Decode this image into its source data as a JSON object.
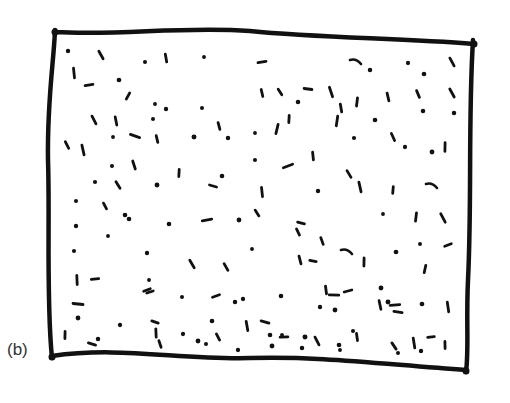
{
  "figure": {
    "panel_label": "(b)",
    "stroke_color": "#111111",
    "background": "#ffffff",
    "frame": {
      "path": "M55,32 C120,36 180,26 250,31 C320,38 400,38 474,44 M473,40 C468,120 472,200 468,280 C466,320 469,350 466,372 M466,370 C380,364 320,356 250,358 C180,360 120,346 52,356 M52,358 C46,300 50,220 48,160 C47,100 54,60 55,30"
    },
    "marks": [
      [
        68,
        51,
        "d"
      ],
      [
        101,
        55,
        "v"
      ],
      [
        145,
        62,
        "d"
      ],
      [
        166,
        58,
        "v"
      ],
      [
        204,
        57,
        "d"
      ],
      [
        74,
        73,
        "v"
      ],
      [
        89,
        85,
        "h"
      ],
      [
        119,
        80,
        "d"
      ],
      [
        128,
        96,
        "s"
      ],
      [
        155,
        104,
        "d"
      ],
      [
        166,
        109,
        "d"
      ],
      [
        202,
        108,
        "d"
      ],
      [
        94,
        120,
        "v"
      ],
      [
        116,
        121,
        "v"
      ],
      [
        153,
        119,
        "d"
      ],
      [
        113,
        137,
        "d"
      ],
      [
        135,
        136,
        "h"
      ],
      [
        157,
        139,
        "v"
      ],
      [
        194,
        137,
        "d"
      ],
      [
        219,
        126,
        "v"
      ],
      [
        228,
        138,
        "d"
      ],
      [
        222,
        176,
        "d"
      ],
      [
        67,
        145,
        "v"
      ],
      [
        83,
        150,
        "v"
      ],
      [
        112,
        166,
        "d"
      ],
      [
        134,
        165,
        "v"
      ],
      [
        179,
        173,
        "v"
      ],
      [
        95,
        182,
        "d"
      ],
      [
        118,
        185,
        "v"
      ],
      [
        157,
        185,
        "d"
      ],
      [
        213,
        186,
        "h"
      ],
      [
        262,
        62,
        "h"
      ],
      [
        356,
        62,
        "c"
      ],
      [
        370,
        70,
        "d"
      ],
      [
        408,
        63,
        "d"
      ],
      [
        424,
        74,
        "d"
      ],
      [
        452,
        62,
        "v"
      ],
      [
        262,
        93,
        "v"
      ],
      [
        280,
        92,
        "v"
      ],
      [
        308,
        89,
        "h"
      ],
      [
        298,
        102,
        "d"
      ],
      [
        331,
        92,
        "v"
      ],
      [
        341,
        108,
        "v"
      ],
      [
        357,
        102,
        "v"
      ],
      [
        388,
        97,
        "v"
      ],
      [
        418,
        94,
        "v"
      ],
      [
        452,
        93,
        "v"
      ],
      [
        289,
        119,
        "v"
      ],
      [
        277,
        129,
        "v"
      ],
      [
        337,
        121,
        "v"
      ],
      [
        375,
        120,
        "d"
      ],
      [
        423,
        111,
        "d"
      ],
      [
        454,
        113,
        "d"
      ],
      [
        255,
        133,
        "d"
      ],
      [
        354,
        138,
        "d"
      ],
      [
        393,
        137,
        "v"
      ],
      [
        405,
        147,
        "d"
      ],
      [
        445,
        147,
        "v"
      ],
      [
        255,
        160,
        "d"
      ],
      [
        288,
        166,
        "h"
      ],
      [
        313,
        156,
        "v"
      ],
      [
        349,
        174,
        "v"
      ],
      [
        360,
        187,
        "v"
      ],
      [
        432,
        186,
        "c"
      ],
      [
        262,
        192,
        "v"
      ],
      [
        318,
        191,
        "d"
      ],
      [
        393,
        190,
        "v"
      ],
      [
        432,
        152,
        "d"
      ],
      [
        76,
        201,
        "d"
      ],
      [
        105,
        206,
        "v"
      ],
      [
        125,
        215,
        "d"
      ],
      [
        129,
        219,
        "d"
      ],
      [
        169,
        224,
        "d"
      ],
      [
        207,
        220,
        "h"
      ],
      [
        239,
        220,
        "d"
      ],
      [
        257,
        213,
        "v"
      ],
      [
        301,
        223,
        "s"
      ],
      [
        383,
        214,
        "d"
      ],
      [
        416,
        217,
        "v"
      ],
      [
        443,
        218,
        "v"
      ],
      [
        76,
        226,
        "d"
      ],
      [
        108,
        236,
        "d"
      ],
      [
        74,
        251,
        "d"
      ],
      [
        147,
        253,
        "d"
      ],
      [
        252,
        249,
        "d"
      ],
      [
        298,
        232,
        "s"
      ],
      [
        322,
        241,
        "v"
      ],
      [
        347,
        252,
        "c"
      ],
      [
        396,
        252,
        "d"
      ],
      [
        420,
        244,
        "d"
      ],
      [
        448,
        245,
        "h"
      ],
      [
        192,
        264,
        "v"
      ],
      [
        226,
        267,
        "v"
      ],
      [
        300,
        260,
        "v"
      ],
      [
        313,
        261,
        "h"
      ],
      [
        364,
        262,
        "v"
      ],
      [
        425,
        269,
        "v"
      ],
      [
        77,
        280,
        "v"
      ],
      [
        95,
        279,
        "h"
      ],
      [
        149,
        280,
        "d"
      ],
      [
        147,
        290,
        "s"
      ],
      [
        150,
        292,
        "h"
      ],
      [
        182,
        297,
        "d"
      ],
      [
        216,
        296,
        "h"
      ],
      [
        235,
        302,
        "d"
      ],
      [
        243,
        299,
        "d"
      ],
      [
        326,
        290,
        "v"
      ],
      [
        334,
        295,
        "h"
      ],
      [
        348,
        291,
        "h"
      ],
      [
        381,
        288,
        "d"
      ],
      [
        281,
        296,
        "d"
      ],
      [
        320,
        307,
        "d"
      ],
      [
        335,
        310,
        "d"
      ],
      [
        380,
        305,
        "v"
      ],
      [
        388,
        302,
        "d"
      ],
      [
        395,
        305,
        "h"
      ],
      [
        398,
        312,
        "h"
      ],
      [
        422,
        304,
        "d"
      ],
      [
        448,
        307,
        "v"
      ],
      [
        78,
        304,
        "h"
      ],
      [
        78,
        318,
        "d"
      ],
      [
        120,
        325,
        "d"
      ],
      [
        155,
        322,
        "h"
      ],
      [
        156,
        333,
        "v"
      ],
      [
        183,
        334,
        "d"
      ],
      [
        212,
        321,
        "d"
      ],
      [
        247,
        326,
        "v"
      ],
      [
        265,
        322,
        "h"
      ],
      [
        270,
        335,
        "d"
      ],
      [
        282,
        335,
        "d"
      ],
      [
        284,
        337,
        "h"
      ],
      [
        305,
        337,
        "d"
      ],
      [
        317,
        341,
        "v"
      ],
      [
        339,
        345,
        "d"
      ],
      [
        353,
        331,
        "d"
      ],
      [
        357,
        337,
        "v"
      ],
      [
        394,
        346,
        "v"
      ],
      [
        414,
        343,
        "v"
      ],
      [
        431,
        337,
        "h"
      ],
      [
        445,
        345,
        "v"
      ],
      [
        65,
        335,
        "v"
      ],
      [
        92,
        344,
        "h"
      ],
      [
        98,
        339,
        "d"
      ],
      [
        160,
        344,
        "s"
      ],
      [
        198,
        341,
        "d"
      ],
      [
        206,
        344,
        "d"
      ],
      [
        218,
        337,
        "s"
      ],
      [
        238,
        350,
        "d"
      ],
      [
        272,
        346,
        "d"
      ],
      [
        302,
        348,
        "d"
      ],
      [
        340,
        350,
        "d"
      ],
      [
        398,
        353,
        "d"
      ],
      [
        421,
        351,
        "d"
      ]
    ]
  }
}
